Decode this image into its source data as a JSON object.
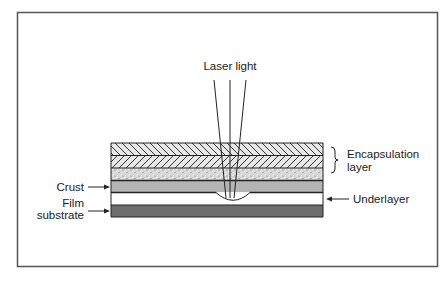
{
  "figure": {
    "frame_color": "#555555",
    "labels": {
      "laser": "Laser light",
      "encapsulation_line1": "Encapsulation",
      "encapsulation_line2": "layer",
      "crust": "Crust",
      "film_line1": "Film",
      "film_line2": "substrate",
      "underlayer": "Underlayer"
    },
    "layers": [
      {
        "name": "encapsulation-hatch-1",
        "pattern": "diagonal-backslash"
      },
      {
        "name": "encapsulation-hatch-2",
        "pattern": "diagonal-slash"
      },
      {
        "name": "encapsulation-speckle",
        "pattern": "speckle"
      },
      {
        "name": "crust",
        "pattern": "solid",
        "color": "#b4b4b4"
      },
      {
        "name": "underlayer",
        "pattern": "solid",
        "color": "#ffffff"
      },
      {
        "name": "film-substrate",
        "pattern": "solid",
        "color": "#6e6e6e"
      }
    ]
  }
}
